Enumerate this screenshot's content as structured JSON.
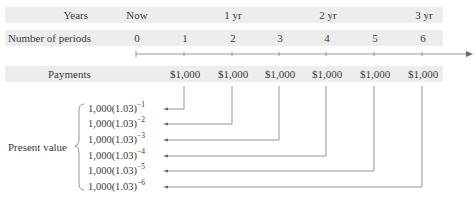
{
  "rows": {
    "years": {
      "label": "Years",
      "ticks": [
        {
          "text": "Now",
          "x": 136
        },
        {
          "text": "1 yr",
          "x": 232
        },
        {
          "text": "2 yr",
          "x": 326
        },
        {
          "text": "3 yr",
          "x": 422
        }
      ]
    },
    "periods": {
      "label": "Number of periods",
      "values": [
        "0",
        "1",
        "2",
        "3",
        "4",
        "5",
        "6"
      ]
    },
    "payments": {
      "label": "Payments",
      "values": [
        "$1,000",
        "$1,000",
        "$1,000",
        "$1,000",
        "$1,000",
        "$1,000"
      ]
    }
  },
  "present_value": {
    "label": "Present value",
    "terms": [
      {
        "base": "1,000(1.03)",
        "exponent": "−1"
      },
      {
        "base": "1,000(1.03)",
        "exponent": "−2"
      },
      {
        "base": "1,000(1.03)",
        "exponent": "−3"
      },
      {
        "base": "1,000(1.03)",
        "exponent": "−4"
      },
      {
        "base": "1,000(1.03)",
        "exponent": "−5"
      },
      {
        "base": "1,000(1.03)",
        "exponent": "−6"
      }
    ]
  },
  "colors": {
    "band": "#ededed",
    "line": "#8a8a8a",
    "text": "#3a3a3a"
  }
}
